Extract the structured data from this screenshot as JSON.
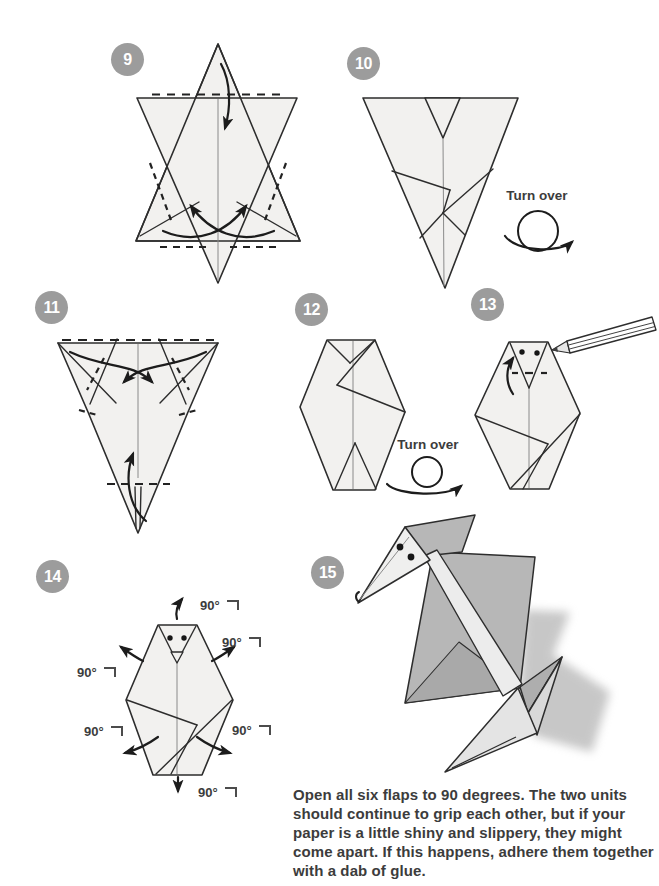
{
  "page": {
    "width": 659,
    "height": 886,
    "background": "#ffffff"
  },
  "colors": {
    "badge_bg": "#9c9c9c",
    "badge_text": "#ffffff",
    "paper_fill": "#f2f1ef",
    "outline": "#2d2d2d",
    "crease": "#8a8a8a",
    "arrow": "#1c1c1c",
    "mid_gray": "#b7b7b7",
    "light_gray": "#e4e4e4",
    "lightest_gray": "#ececec",
    "shadow": "#909090",
    "text": "#3c3c3c"
  },
  "steps": [
    {
      "number": "9"
    },
    {
      "number": "10",
      "note": "Turn over"
    },
    {
      "number": "11"
    },
    {
      "number": "12",
      "note": "Turn over"
    },
    {
      "number": "13"
    },
    {
      "number": "14",
      "angle_labels": [
        "90°",
        "90°",
        "90°",
        "90°",
        "90°",
        "90°"
      ]
    },
    {
      "number": "15"
    }
  ],
  "caption": {
    "text": "Open all six flaps to 90 degrees. The two units should continue to grip each other, but if your paper is a little shiny and slippery, they might come apart. If this happens, adhere them together with a dab of glue."
  }
}
